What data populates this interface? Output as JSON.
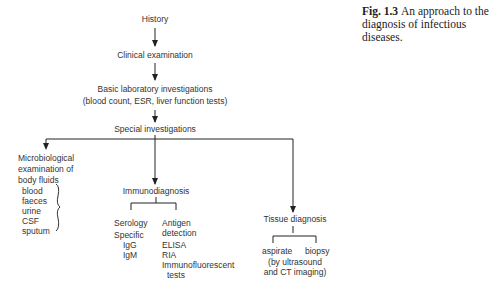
{
  "caption": {
    "label": "Fig. 1.3",
    "text": "An approach to the diagnosis of infectious diseases."
  },
  "nodes": {
    "history": "History",
    "clinical": "Clinical examination",
    "basic_lab_1": "Basic laboratory investigations",
    "basic_lab_2": "(blood count, ESR, liver function tests)",
    "special": "Special investigations",
    "micro": {
      "line1": "Microbiological",
      "line2": "examination of",
      "line3": "body fluids",
      "items": [
        "blood",
        "faeces",
        "urine",
        "CSF",
        "sputum"
      ]
    },
    "immuno": {
      "title": "Immunodiagnosis",
      "serology": {
        "title": "Serology",
        "sub": "Specific",
        "items": [
          "IgG",
          "IgM"
        ]
      },
      "antigen": {
        "title1": "Antigen",
        "title2": "detection",
        "items": [
          "ELISA",
          "RIA",
          "Immunofluorescent",
          "tests"
        ]
      }
    },
    "tissue": {
      "title": "Tissue diagnosis",
      "aspirate": "aspirate",
      "biopsy": "biopsy",
      "note1": "(by ultrasound",
      "note2": "and CT imaging)"
    }
  },
  "colors": {
    "line": "#333333",
    "text": "#333333"
  }
}
